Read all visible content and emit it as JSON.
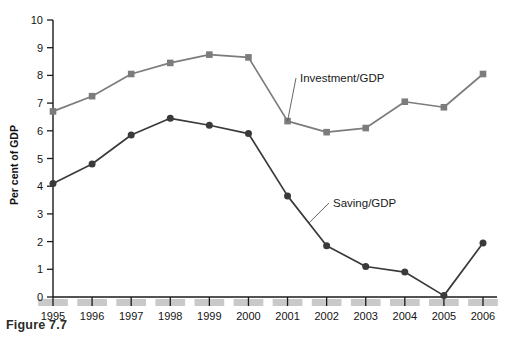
{
  "caption": "Figure 7.7",
  "axis": {
    "ylabel": "Per cent of GDP",
    "yticks": [
      "0",
      "1",
      "2",
      "3",
      "4",
      "5",
      "6",
      "7",
      "8",
      "9",
      "10"
    ],
    "xticks": [
      "1995",
      "1996",
      "1997",
      "1998",
      "1999",
      "2000",
      "2001",
      "2002",
      "2003",
      "2004",
      "2005",
      "2006"
    ]
  },
  "annotations": {
    "investment": "Investment/GDP",
    "saving": "Saving/GDP"
  },
  "colors": {
    "investment": "#7c7c7c",
    "saving": "#3a3a3a",
    "axis": "#1a1a1a",
    "band": "#c9c9c9",
    "background": "#ffffff"
  },
  "chart_data": {
    "type": "line",
    "title": "",
    "xlabel": "",
    "ylabel": "Per cent of GDP",
    "ylim": [
      0,
      10
    ],
    "grid": false,
    "legend_position": "inline-annotations",
    "x": [
      "1995",
      "1996",
      "1997",
      "1998",
      "1999",
      "2000",
      "2001",
      "2002",
      "2003",
      "2004",
      "2005",
      "2006"
    ],
    "series": [
      {
        "name": "Investment/GDP",
        "marker": "square",
        "color": "#7c7c7c",
        "values": [
          6.7,
          7.25,
          8.05,
          8.45,
          8.75,
          8.65,
          6.35,
          5.95,
          6.1,
          7.05,
          6.85,
          8.05
        ]
      },
      {
        "name": "Saving/GDP",
        "marker": "circle",
        "color": "#3a3a3a",
        "values": [
          4.1,
          4.8,
          5.85,
          6.45,
          6.2,
          5.9,
          3.65,
          1.85,
          1.1,
          0.9,
          0.05,
          1.95
        ]
      }
    ]
  }
}
